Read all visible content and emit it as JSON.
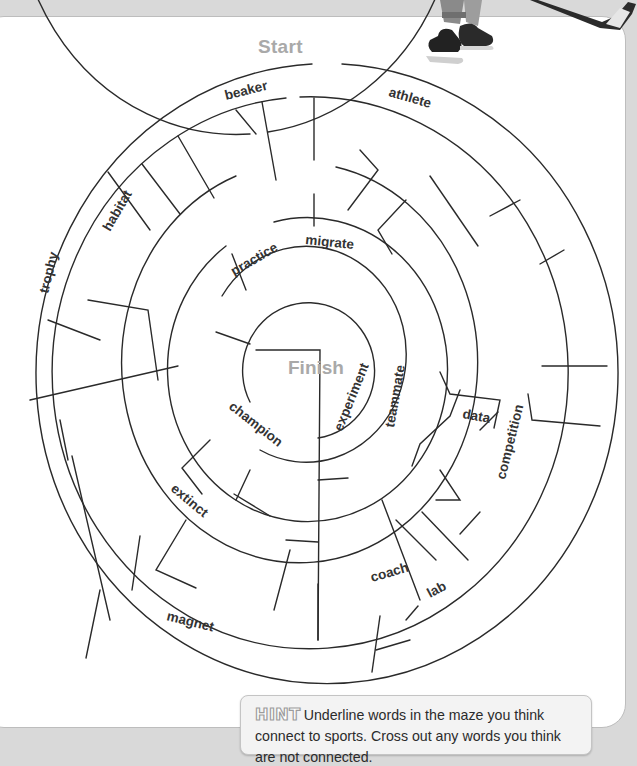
{
  "maze": {
    "start_label": "Start",
    "finish_label": "Finish",
    "words": [
      {
        "id": "beaker",
        "text": "beaker"
      },
      {
        "id": "athlete",
        "text": "athlete"
      },
      {
        "id": "habitat",
        "text": "habitat"
      },
      {
        "id": "trophy",
        "text": "trophy"
      },
      {
        "id": "practice",
        "text": "practice"
      },
      {
        "id": "migrate",
        "text": "migrate"
      },
      {
        "id": "experiment",
        "text": "experiment"
      },
      {
        "id": "teammate",
        "text": "teammate"
      },
      {
        "id": "champion",
        "text": "champion"
      },
      {
        "id": "data",
        "text": "data"
      },
      {
        "id": "competition",
        "text": "competition"
      },
      {
        "id": "extinct",
        "text": "extinct"
      },
      {
        "id": "coach",
        "text": "coach"
      },
      {
        "id": "lab",
        "text": "lab"
      },
      {
        "id": "magnet",
        "text": "magnet"
      }
    ]
  },
  "hint": {
    "badge": "HINT",
    "text": "Underline words in the maze you think connect to sports. Cross out any words you think are not connected."
  },
  "illustration": {
    "subject": "hockey-player-skates-and-stick"
  },
  "colors": {
    "maze_line": "#2a2a2a",
    "start_finish_text": "#a9a9a9",
    "hint_background": "#f3f3f3",
    "page_background": "#ffffff",
    "outer_background": "#d9d9d9"
  }
}
